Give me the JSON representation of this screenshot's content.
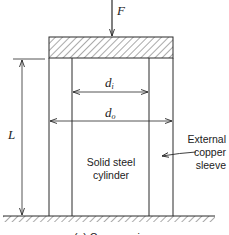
{
  "diagram": {
    "labels": {
      "force": "F",
      "length": "L",
      "inner_diameter": "d",
      "inner_diameter_sub": "i",
      "outer_diameter": "d",
      "outer_diameter_sub": "o",
      "inner_part": [
        "Solid steel",
        "cylinder"
      ],
      "outer_part": [
        "External",
        "copper",
        "sleeve"
      ],
      "caption": "(a) Compression"
    },
    "colors": {
      "line": "#2a2a2a",
      "hatch": "#555555",
      "background": "#ffffff"
    }
  }
}
